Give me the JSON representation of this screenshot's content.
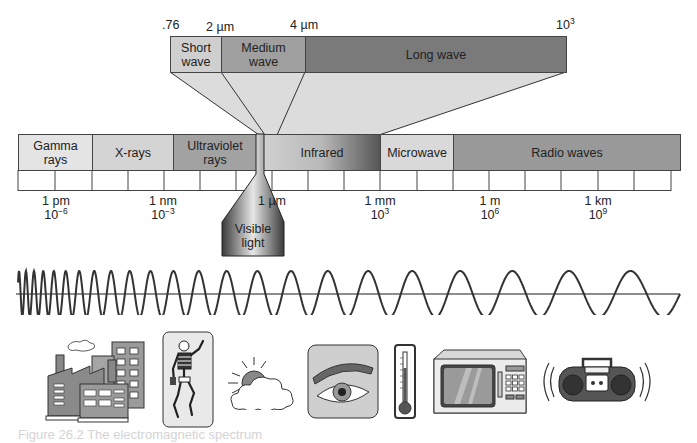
{
  "diagram": {
    "title": "Electromagnetic spectrum",
    "ir_detail": {
      "top_labels": [
        {
          "text": ".76",
          "x": 176
        },
        {
          "text": "2 µm",
          "x": 222
        },
        {
          "text": "4 µm",
          "x": 306
        },
        {
          "text": "10",
          "sup": "3",
          "x": 540
        }
      ],
      "bands": [
        {
          "label_line1": "Short",
          "label_line2": "wave",
          "color": "#cfcfcf"
        },
        {
          "label_line1": "Medium",
          "label_line2": "wave",
          "color": "#9f9f9f"
        },
        {
          "label_line1": "Long wave",
          "label_line2": "",
          "color": "#7a7a7a"
        }
      ]
    },
    "spectrum_bands": [
      {
        "label_line1": "Gamma",
        "label_line2": "rays",
        "color": "#e4e4e4"
      },
      {
        "label_line1": "X-rays",
        "label_line2": "",
        "color": "#d4d4d4"
      },
      {
        "label_line1": "Ultraviolet",
        "label_line2": "rays",
        "color": "#a2a2a2"
      },
      {
        "label_line1": "Infrared",
        "label_line2": "",
        "color": "gradient"
      },
      {
        "label_line1": "Microwave",
        "label_line2": "",
        "color": "#d9d9d9"
      },
      {
        "label_line1": "Radio waves",
        "label_line2": "",
        "color": "#999999"
      }
    ],
    "scale_ticks": [
      {
        "unit": "1 pm",
        "base": "10",
        "exp": "−6"
      },
      {
        "unit": "1 nm",
        "base": "10",
        "exp": "−3"
      },
      {
        "unit": "1 µm",
        "base": "",
        "exp": ""
      },
      {
        "unit": "1 mm",
        "base": "10",
        "exp": "3"
      },
      {
        "unit": "1 m",
        "base": "10",
        "exp": "6"
      },
      {
        "unit": "1 km",
        "base": "10",
        "exp": "9"
      }
    ],
    "visible_light": {
      "line1": "Visible",
      "line2": "light"
    },
    "icons": [
      "factory-buildings-icon",
      "skeleton-xray-icon",
      "sun-cloud-icon",
      "eye-icon",
      "thermometer-icon",
      "microwave-oven-icon",
      "boombox-radio-icon"
    ],
    "caption": "Figure 26.2  The electromagnetic spectrum"
  }
}
